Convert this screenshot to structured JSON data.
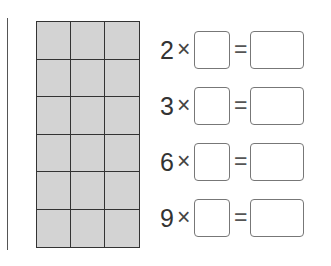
{
  "grid": {
    "rows": 6,
    "cols": 3,
    "fill_color": "#d3d3d3"
  },
  "equations": [
    {
      "multiplier": "2",
      "times": "×",
      "equals": "=",
      "factor_value": "",
      "product_value": ""
    },
    {
      "multiplier": "3",
      "times": "×",
      "equals": "=",
      "factor_value": "",
      "product_value": ""
    },
    {
      "multiplier": "6",
      "times": "×",
      "equals": "=",
      "factor_value": "",
      "product_value": ""
    },
    {
      "multiplier": "9",
      "times": "×",
      "equals": "=",
      "factor_value": "",
      "product_value": ""
    }
  ]
}
